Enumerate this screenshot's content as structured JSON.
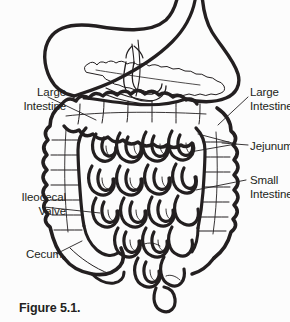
{
  "figure": {
    "caption": "Figure 5.1.",
    "background_color": "#fcfcfc",
    "ink_color": "#231f20",
    "width": 290,
    "height": 322
  },
  "labels": {
    "large_intestine_left": {
      "line1": "Large",
      "line2": "Intestine"
    },
    "large_intestine_right": {
      "line1": "Large",
      "line2": "Intestine"
    },
    "jejunum": {
      "line1": "Jejunum"
    },
    "small_intestine": {
      "line1": "Small",
      "line2": "Intestine"
    },
    "ileocecal_valve": {
      "line1": "Ileocecal",
      "line2": "Valve"
    },
    "cecum": {
      "line1": "Cecum"
    }
  },
  "anatomy": {
    "structures": [
      "stomach",
      "pancreas",
      "duodenum",
      "transverse-colon",
      "ascending-colon",
      "descending-colon",
      "cecum",
      "appendix",
      "jejunum",
      "ileum",
      "small-intestine-coils"
    ]
  }
}
